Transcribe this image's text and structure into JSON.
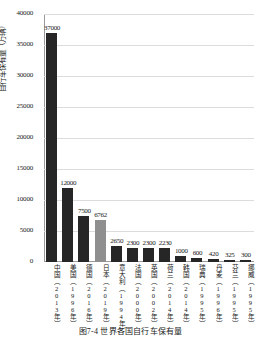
{
  "chart_data": {
    "type": "bar",
    "title": "",
    "xlabel": "",
    "ylabel": "自行车保有量（万辆）",
    "ylim": [
      0,
      40000
    ],
    "yticks": [
      40000,
      35000,
      30000,
      25000,
      20000,
      15000,
      10000,
      5000,
      0
    ],
    "ytick_labels": [
      "40000",
      "35000",
      "30000",
      "25000",
      "20000",
      "15000",
      "10000",
      "5000",
      "0"
    ],
    "grid": true,
    "legend": "none",
    "categories": [
      "中国（2013年）",
      "美国（1996年）",
      "德国（2016年）",
      "日本（2019年）",
      "意大利（1994年）",
      "法国（2000年）",
      "英国（2002年）",
      "荷兰（2014年）",
      "韩国（2014年）",
      "瑞典（1995年）",
      "丹麦（1996年）",
      "芬兰（1995年）",
      "挪威（1995年）"
    ],
    "country_names": [
      "中国",
      "美国",
      "德国",
      "日本",
      "意大利",
      "法国",
      "英国",
      "荷兰",
      "韩国",
      "瑞典",
      "丹麦",
      "芬兰",
      "挪威"
    ],
    "years": [
      "2013年",
      "1996年",
      "2016年",
      "2019年",
      "1994年",
      "2000年",
      "2002年",
      "2014年",
      "2014年",
      "1995年",
      "1996年",
      "1995年",
      "1995年"
    ],
    "values": [
      37000,
      12000,
      7500,
      6762,
      2650,
      2300,
      2300,
      2230,
      1000,
      600,
      420,
      325,
      300
    ],
    "value_labels": [
      "37000",
      "12000",
      "7500",
      "6762",
      "2650",
      "2300",
      "2300",
      "2230",
      "1000",
      "600",
      "420",
      "325",
      "300"
    ],
    "bar_colors": [
      "dark",
      "dark",
      "dark",
      "light",
      "dark",
      "dark",
      "dark",
      "dark",
      "dark",
      "dark",
      "dark",
      "dark",
      "dark"
    ],
    "colors": {
      "bar_dark": "#262626",
      "bar_light": "#8f8f8f",
      "grid": "#dcdcdc",
      "axis": "#9a9a9a",
      "text": "#1a1a1a",
      "background": "#ffffff"
    }
  },
  "caption": {
    "text": "图7-4  世界各国自行车保有量"
  }
}
